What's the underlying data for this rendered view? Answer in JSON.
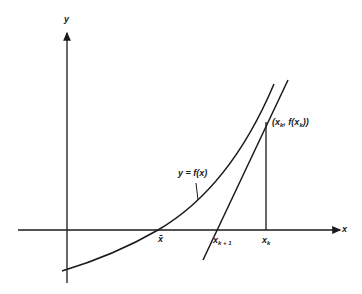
{
  "figure": {
    "axes": {
      "x_label": "x",
      "y_label": "y"
    },
    "curve_label": "y = f(x)",
    "point_label": {
      "open": "(x",
      "sub1": "k",
      "mid": ", f(x",
      "sub2": "k",
      "close": "))"
    },
    "ticks": {
      "root": "x̄",
      "next": {
        "base": "x",
        "sub": "k + 1"
      },
      "current": {
        "base": "x",
        "sub": "k"
      }
    },
    "colors": {
      "ink": "#1a1a1a",
      "background": "#ffffff"
    }
  }
}
